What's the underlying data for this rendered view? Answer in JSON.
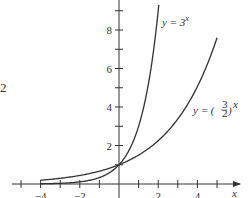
{
  "chart_data": {
    "type": "line",
    "title": "",
    "xlabel": "x",
    "ylabel": "",
    "xlim": [
      -5,
      5.5
    ],
    "ylim": [
      0,
      9.5
    ],
    "grid": false,
    "x_tick_labels": [
      "−4",
      "−2",
      "2",
      "4"
    ],
    "x_tick_values": [
      -4,
      -2,
      2,
      4
    ],
    "x_minor_ticks": [
      -5,
      -4,
      -3,
      -2,
      -1,
      1,
      2,
      3,
      4,
      5
    ],
    "y_tick_labels": [
      "2",
      "4",
      "6",
      "8"
    ],
    "y_tick_values": [
      2,
      4,
      6,
      8
    ],
    "y_minor_ticks": [
      1,
      2,
      3,
      4,
      5,
      6,
      7,
      8,
      9
    ],
    "series": [
      {
        "name": "y = 3^x",
        "label_text": "y = 3",
        "label_sup": "x",
        "domain": [
          -4,
          2.03
        ],
        "x": [
          -4,
          -3,
          -2,
          -1,
          0,
          1,
          2
        ],
        "values": [
          0.012,
          0.037,
          0.111,
          0.333,
          1,
          3,
          9
        ]
      },
      {
        "name": "y = (3/2)^x",
        "label_text": "y = (",
        "label_frac_num": "3",
        "label_frac_den": "2",
        "label_sup": "x",
        "domain": [
          -4,
          5
        ],
        "x": [
          -4,
          -3,
          -2,
          -1,
          0,
          1,
          2,
          3,
          4,
          5
        ],
        "values": [
          0.198,
          0.296,
          0.444,
          0.667,
          1,
          1.5,
          2.25,
          3.375,
          5.0625,
          7.594
        ]
      }
    ],
    "annotations": [
      "y = 3^x",
      "y = (3/2)^x"
    ]
  },
  "edge_fragment": "2"
}
